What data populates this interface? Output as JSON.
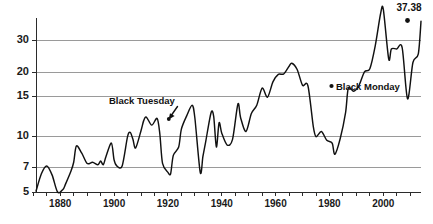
{
  "chart_data": {
    "type": "line",
    "title": "",
    "subtitle": "",
    "xlabel": "",
    "ylabel": "",
    "yscale": "log",
    "ylim": [
      4.6,
      40
    ],
    "xlim": [
      1871,
      2014
    ],
    "grid": true,
    "grid_axis": "y",
    "legend": false,
    "legend_position": "none",
    "y_ticks": [
      5,
      7,
      10,
      15,
      20,
      30
    ],
    "y_tick_labels": [
      "5",
      "7",
      "10",
      "15",
      "20",
      "30"
    ],
    "x_ticks": [
      1880,
      1900,
      1920,
      1940,
      1960,
      1980,
      2000
    ],
    "x_tick_labels": [
      "1880",
      "1900",
      "1920",
      "1940",
      "1960",
      "1980",
      "2000"
    ],
    "x_minor_ticks": [
      1870,
      1875,
      1880,
      1885,
      1890,
      1895,
      1900,
      1905,
      1910,
      1915,
      1920,
      1925,
      1930,
      1935,
      1940,
      1945,
      1950,
      1955,
      1960,
      1965,
      1970,
      1975,
      1980,
      1985,
      1990,
      1995,
      2000,
      2005,
      2010
    ],
    "series": [
      {
        "name": "Cyclically Adjusted Price-to-Earnings Ratio",
        "color": "#111111",
        "x": [
          1871,
          1873,
          1875,
          1877,
          1879,
          1881,
          1882,
          1884,
          1885,
          1886,
          1888,
          1890,
          1892,
          1894,
          1895,
          1896,
          1897,
          1899,
          1900,
          1901,
          1903,
          1905,
          1906,
          1907,
          1908,
          1910,
          1911,
          1912,
          1914,
          1916,
          1917,
          1918,
          1920,
          1921,
          1922,
          1924,
          1925,
          1927,
          1929,
          1930,
          1932,
          1933,
          1934,
          1936,
          1937,
          1938,
          1939,
          1940,
          1942,
          1944,
          1946,
          1947,
          1949,
          1951,
          1953,
          1955,
          1957,
          1959,
          1961,
          1963,
          1965,
          1966,
          1968,
          1970,
          1972,
          1974,
          1975,
          1977,
          1979,
          1981,
          1982,
          1984,
          1986,
          1987,
          1989,
          1991,
          1993,
          1995,
          1997,
          1999,
          2000,
          2002,
          2003,
          2005,
          2007,
          2009,
          2011,
          2013,
          2014
        ],
        "y": [
          5.05,
          6.2,
          6.8,
          6.1,
          5.0,
          5.15,
          5.5,
          6.4,
          7.1,
          8.6,
          7.9,
          7.0,
          7.1,
          6.9,
          7.2,
          6.9,
          7.6,
          8.9,
          7.3,
          6.8,
          6.8,
          9.6,
          10.1,
          9.3,
          8.4,
          10.3,
          11.6,
          12.1,
          11.0,
          11.9,
          9.9,
          7.0,
          6.3,
          6.2,
          7.7,
          8.5,
          10.5,
          12.3,
          13.9,
          12.0,
          6.3,
          7.6,
          9.0,
          12.7,
          12.2,
          8.5,
          11.3,
          10.0,
          8.7,
          9.3,
          14.1,
          12.0,
          10.2,
          12.6,
          13.9,
          17.0,
          15.3,
          18.3,
          20.0,
          20.1,
          22.0,
          22.8,
          21.2,
          17.6,
          17.5,
          10.8,
          9.6,
          10.2,
          9.2,
          8.9,
          7.8,
          9.4,
          12.8,
          17.0,
          16.4,
          17.6,
          20.6,
          21.4,
          28.0,
          41.0,
          43.0,
          24.0,
          27.0,
          27.0,
          27.4,
          15.0,
          23.0,
          25.5,
          37.38
        ],
        "end_value": 37.38,
        "end_label": "37.38"
      }
    ],
    "annotations": [
      {
        "label": "Black Tuesday",
        "x": 1929,
        "y": 13.9,
        "label_x": 1922,
        "label_y": 19.8
      },
      {
        "label": "Black Monday",
        "x": 1987,
        "y": 17.0,
        "label_x": 1991,
        "label_y": 17.0
      },
      {
        "label": "37.38",
        "x": 2014,
        "y": 37.38,
        "label_x": 2014,
        "label_y": 46.0
      }
    ]
  },
  "axis": {
    "y_labels": [
      "30",
      "20",
      "15",
      "10",
      "7",
      "5"
    ],
    "x_labels": [
      "1880",
      "1900",
      "1920",
      "1940",
      "1960",
      "1980",
      "2000"
    ]
  },
  "annotations": {
    "black_tuesday": "Black Tuesday",
    "black_monday": "Black Monday",
    "end_value": "37.38"
  },
  "colors": {
    "line": "#111111",
    "grid": "#9a9a9a",
    "axis": "#2b2b2b",
    "text": "#1a1a1a",
    "background": "#ffffff"
  }
}
